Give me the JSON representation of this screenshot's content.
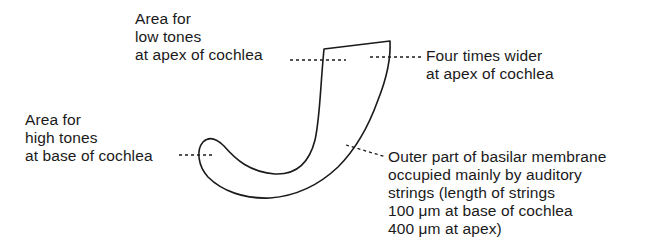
{
  "diagram": {
    "labels": {
      "low_tones": {
        "lines": [
          "Area for",
          "low tones",
          "at apex of cochlea"
        ]
      },
      "high_tones": {
        "lines": [
          "Area for",
          "high tones",
          "at base of cochlea"
        ]
      },
      "wider": {
        "lines": [
          "Four times wider",
          "at apex of cochlea"
        ]
      },
      "outer_part": {
        "lines": [
          "Outer part of basilar membrane",
          "occupied mainly by auditory",
          "strings (length of strings",
          "100 μm at base of cochlea",
          "400 μm at apex)"
        ]
      }
    },
    "colors": {
      "stroke": "#1a1a1a",
      "background": "#ffffff"
    }
  }
}
